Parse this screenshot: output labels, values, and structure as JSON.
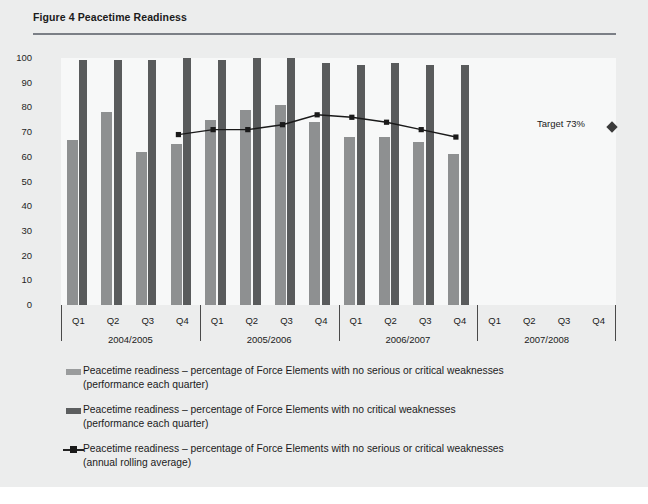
{
  "figure": {
    "title": "Figure 4 Peacetime Readiness"
  },
  "annotation": {
    "target_label": "Target 73%",
    "target_marker": "diamond-marker"
  },
  "axis": {
    "y_ticks": [
      "100",
      "90",
      "80",
      "70",
      "60",
      "50",
      "40",
      "30",
      "20",
      "10",
      "0"
    ],
    "quarters": [
      "Q1",
      "Q2",
      "Q3",
      "Q4"
    ],
    "years": [
      "2004/2005",
      "2005/2006",
      "2006/2007",
      "2007/2008"
    ]
  },
  "legend": [
    {
      "marker": "light-bar-swatch",
      "line1": "Peacetime readiness – percentage of Force Elements with no serious or critical weaknesses",
      "line2": "(performance each quarter)"
    },
    {
      "marker": "dark-bar-swatch",
      "line1": "Peacetime readiness – percentage of Force Elements with no critical weaknesses",
      "line2": "(performance each quarter)"
    },
    {
      "marker": "line-marker-swatch",
      "line1": "Peacetime readiness – percentage of Force Elements with no serious or critical weaknesses",
      "line2": "(annual rolling average)"
    }
  ],
  "colors": {
    "bar_light": "#8e9091",
    "bar_dark": "#595b5c",
    "line": "#1a1a1a",
    "rule": "#7b7f86",
    "panel": "#eceded",
    "plot": "#f7f8f8"
  },
  "chart_data": {
    "type": "bar",
    "title": "Figure 4 Peacetime Readiness",
    "xlabel": "",
    "ylabel": "",
    "ylim": [
      0,
      100
    ],
    "ytick_step": 10,
    "grid": false,
    "legend_position": "below",
    "categories": [
      "2004/2005 Q1",
      "2004/2005 Q2",
      "2004/2005 Q3",
      "2004/2005 Q4",
      "2005/2006 Q1",
      "2005/2006 Q2",
      "2005/2006 Q3",
      "2005/2006 Q4",
      "2006/2007 Q1",
      "2006/2007 Q2",
      "2006/2007 Q3",
      "2006/2007 Q4",
      "2007/2008 Q1",
      "2007/2008 Q2",
      "2007/2008 Q3",
      "2007/2008 Q4"
    ],
    "series": [
      {
        "name": "Peacetime readiness – percentage of Force Elements with no serious or critical weaknesses (performance each quarter)",
        "type": "bar",
        "color": "#8e9091",
        "values": [
          67,
          78,
          62,
          65,
          75,
          79,
          81,
          74,
          68,
          68,
          66,
          61,
          null,
          null,
          null,
          null
        ]
      },
      {
        "name": "Peacetime readiness – percentage of Force Elements with no critical weaknesses (performance each quarter)",
        "type": "bar",
        "color": "#595b5c",
        "values": [
          99,
          99,
          99,
          100,
          99,
          100,
          100,
          98,
          97,
          98,
          97,
          97,
          null,
          null,
          null,
          null
        ]
      },
      {
        "name": "Peacetime readiness – percentage of Force Elements with no serious or critical weaknesses (annual rolling average)",
        "type": "line",
        "color": "#1a1a1a",
        "values": [
          null,
          null,
          null,
          69,
          71,
          71,
          73,
          77,
          76,
          74,
          71,
          68,
          null,
          null,
          null,
          null
        ]
      }
    ],
    "target": {
      "label": "Target 73%",
      "value": 73
    }
  }
}
